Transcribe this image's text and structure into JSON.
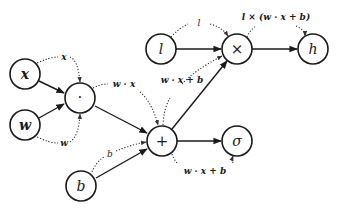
{
  "diagram": {
    "type": "computational-graph",
    "nodes": [
      {
        "id": "x",
        "label": "x",
        "kind": "input"
      },
      {
        "id": "w",
        "label": "w",
        "kind": "input"
      },
      {
        "id": "dot",
        "label": "·",
        "kind": "operation"
      },
      {
        "id": "b",
        "label": "b",
        "kind": "input"
      },
      {
        "id": "plus",
        "label": "+",
        "kind": "operation"
      },
      {
        "id": "l",
        "label": "l",
        "kind": "input"
      },
      {
        "id": "times",
        "label": "×",
        "kind": "operation"
      },
      {
        "id": "h",
        "label": "h",
        "kind": "output"
      },
      {
        "id": "sigma",
        "label": "σ",
        "kind": "output"
      }
    ],
    "edges": [
      {
        "from": "x",
        "to": "dot"
      },
      {
        "from": "w",
        "to": "dot"
      },
      {
        "from": "dot",
        "to": "plus"
      },
      {
        "from": "b",
        "to": "plus"
      },
      {
        "from": "l",
        "to": "times"
      },
      {
        "from": "plus",
        "to": "times"
      },
      {
        "from": "times",
        "to": "h"
      },
      {
        "from": "plus",
        "to": "sigma"
      }
    ],
    "value_annotations": [
      {
        "id": "ann-x",
        "label": "x"
      },
      {
        "id": "ann-w",
        "label": "w"
      },
      {
        "id": "ann-wx",
        "label": "w · x"
      },
      {
        "id": "ann-b",
        "label": "b"
      },
      {
        "id": "ann-wxb-up",
        "label": "w · x + b"
      },
      {
        "id": "ann-l",
        "label": "l"
      },
      {
        "id": "ann-lwxb",
        "label": "l × (w · x + b)"
      },
      {
        "id": "ann-wxb-down",
        "label": "w · x + b"
      }
    ]
  }
}
